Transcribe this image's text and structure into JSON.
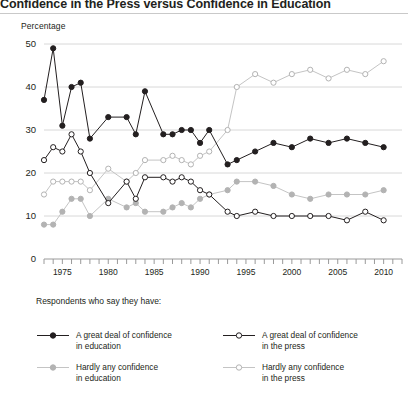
{
  "title": "Confidence in the Press versus Confidence in Education",
  "axis_title": "Percentage",
  "legend": {
    "intro": "Respondents who say they have:",
    "items": [
      {
        "label_line1": "A great deal of confidence",
        "label_line2": "in education",
        "marker": "filled",
        "color": "#231f20"
      },
      {
        "label_line1": "A great deal of confidence",
        "label_line2": "in the press",
        "marker": "open",
        "color": "#231f20"
      },
      {
        "label_line1": "Hardly any confidence",
        "label_line2": "in education",
        "marker": "filled",
        "color": "#b3b3b3"
      },
      {
        "label_line1": "Hardly any confidence",
        "label_line2": "in the press",
        "marker": "open",
        "color": "#b3b3b3"
      }
    ]
  },
  "chart_data": {
    "type": "line",
    "title": "Confidence in the Press versus Confidence in Education",
    "xlabel": "",
    "ylabel": "Percentage",
    "ylim": [
      0,
      50
    ],
    "yticks": [
      0,
      10,
      20,
      30,
      40,
      50
    ],
    "xlim": [
      1973,
      2012
    ],
    "xticks_labeled": [
      1975,
      1980,
      1985,
      1990,
      1995,
      2000,
      2005,
      2010
    ],
    "grid": "horizontal",
    "legend_position": "below",
    "x": [
      1973,
      1974,
      1975,
      1976,
      1977,
      1978,
      1980,
      1982,
      1983,
      1984,
      1986,
      1987,
      1988,
      1989,
      1990,
      1991,
      1993,
      1994,
      1996,
      1998,
      2000,
      2002,
      2004,
      2006,
      2008,
      2010
    ],
    "series": [
      {
        "name": "A great deal of confidence in education",
        "color": "#231f20",
        "marker": "filled",
        "values": [
          37,
          49,
          31,
          40,
          41,
          28,
          33,
          33,
          29,
          39,
          29,
          29,
          30,
          30,
          27,
          30,
          22,
          23,
          25,
          27,
          26,
          28,
          27,
          28,
          27,
          26
        ]
      },
      {
        "name": "A great deal of confidence in the press",
        "color": "#231f20",
        "marker": "open",
        "values": [
          23,
          26,
          25,
          29,
          25,
          20,
          13,
          18,
          14,
          19,
          19,
          18,
          19,
          18,
          16,
          15,
          11,
          10,
          11,
          10,
          10,
          10,
          10,
          9,
          11,
          9
        ]
      },
      {
        "name": "Hardly any confidence in education",
        "color": "#b3b3b3",
        "marker": "filled",
        "values": [
          8,
          8,
          11,
          14,
          14,
          10,
          14,
          12,
          13,
          11,
          11,
          12,
          13,
          12,
          14,
          15,
          16,
          18,
          18,
          17,
          15,
          14,
          15,
          15,
          15,
          16
        ]
      },
      {
        "name": "Hardly any confidence in the press",
        "color": "#b3b3b3",
        "marker": "open",
        "values": [
          15,
          18,
          18,
          18,
          18,
          16,
          21,
          18,
          20,
          23,
          23,
          24,
          23,
          22,
          24,
          25,
          30,
          40,
          43,
          41,
          43,
          44,
          42,
          44,
          43,
          46
        ]
      }
    ]
  }
}
